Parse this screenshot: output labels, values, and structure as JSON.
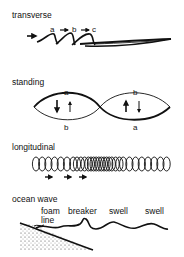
{
  "panels": {
    "transverse": {
      "title": "transverse",
      "markers": [
        "a",
        "b",
        "c"
      ]
    },
    "standing": {
      "title": "standing",
      "loop1": {
        "top": "a",
        "bottom": "b"
      },
      "loop2": {
        "top": "b",
        "bottom": "a"
      }
    },
    "longitudinal": {
      "title": "longitudinal"
    },
    "ocean_wave": {
      "title": "ocean wave",
      "labels": [
        "foam line",
        "breaker",
        "swell",
        "swell"
      ],
      "foam_line_1": "foam",
      "foam_line_2": "line"
    }
  },
  "colors": {
    "ink": "#111111",
    "background": "#ffffff"
  }
}
